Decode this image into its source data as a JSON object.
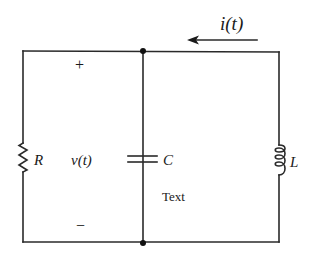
{
  "diagram": {
    "type": "parallel RLC circuit",
    "labels": {
      "current": "i(t)",
      "voltage": "v(t)",
      "plus": "+",
      "minus": "−",
      "resistor": "R",
      "capacitor": "C",
      "inductor": "L",
      "extra_text": "Text"
    },
    "components": [
      {
        "name": "resistor",
        "label": "R",
        "branch": "left"
      },
      {
        "name": "capacitor",
        "label": "C",
        "branch": "middle"
      },
      {
        "name": "inductor",
        "label": "L",
        "branch": "right"
      }
    ],
    "nodes": [
      {
        "name": "top-node"
      },
      {
        "name": "bottom-node"
      }
    ],
    "current_direction": "right-to-left",
    "colors": {
      "wire": "#2a2a2a",
      "background": "#ffffff"
    }
  }
}
